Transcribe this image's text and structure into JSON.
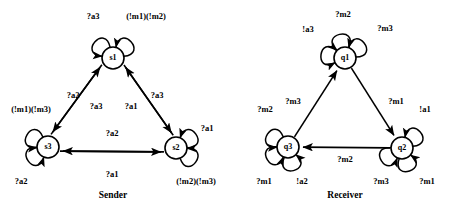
{
  "figure": {
    "background_color": "#ffffff",
    "stroke_color": "#000000",
    "width": 461,
    "height": 219
  },
  "diagrams": [
    {
      "id": "sender",
      "caption": "Sender",
      "caption_pos": {
        "x": 113,
        "y": 196
      },
      "nodes": [
        {
          "id": "s1",
          "label": "s1",
          "cx": 113,
          "cy": 58,
          "r": 11
        },
        {
          "id": "s3",
          "label": "s3",
          "cx": 48,
          "cy": 147,
          "r": 11
        },
        {
          "id": "s2",
          "label": "s2",
          "cx": 176,
          "cy": 148,
          "r": 11
        }
      ],
      "self_loops": [
        {
          "node": "s1",
          "label": "?a3",
          "angle": 138,
          "label_x": 93,
          "label_y": 17
        },
        {
          "node": "s1",
          "label": "(!m1)(!m2)",
          "angle": 42,
          "label_x": 146,
          "label_y": 17
        },
        {
          "node": "s3",
          "label": "(!m1)(!m3)",
          "angle": 150,
          "label_x": 31,
          "label_y": 110
        },
        {
          "node": "s3",
          "label": "?a2",
          "angle": 215,
          "label_x": 21,
          "label_y": 182
        },
        {
          "node": "s2",
          "label": "?a1",
          "angle": 35,
          "label_x": 207,
          "label_y": 129
        },
        {
          "node": "s2",
          "label": "(!m2)(!m3)",
          "angle": 325,
          "label_x": 196,
          "label_y": 182
        }
      ],
      "edges": [
        {
          "from": "s3",
          "to": "s1",
          "label": "?a2",
          "dir": "up",
          "offset": -5,
          "label_x": 73,
          "label_y": 96
        },
        {
          "from": "s1",
          "to": "s3",
          "label": "?a3",
          "dir": "down",
          "offset": 5,
          "label_x": 96,
          "label_y": 107
        },
        {
          "from": "s2",
          "to": "s1",
          "label": "?a1",
          "dir": "up",
          "offset": 5,
          "label_x": 131,
          "label_y": 107
        },
        {
          "from": "s1",
          "to": "s2",
          "label": "?a3",
          "dir": "down",
          "offset": -5,
          "label_x": 157,
          "label_y": 96
        },
        {
          "from": "s2",
          "to": "s3",
          "label": "?a2",
          "dir": "left",
          "offset": -4,
          "label_x": 112,
          "label_y": 134
        },
        {
          "from": "s3",
          "to": "s2",
          "label": "?a1",
          "dir": "right",
          "offset": 4,
          "label_x": 112,
          "label_y": 175
        }
      ]
    },
    {
      "id": "receiver",
      "caption": "Receiver",
      "caption_pos": {
        "x": 345,
        "y": 196
      },
      "nodes": [
        {
          "id": "q1",
          "label": "q1",
          "cx": 345,
          "cy": 58,
          "r": 11
        },
        {
          "id": "q3",
          "label": "q3",
          "cx": 288,
          "cy": 147,
          "r": 11
        },
        {
          "id": "q2",
          "label": "q2",
          "cx": 402,
          "cy": 148,
          "r": 11
        }
      ],
      "self_loops": [
        {
          "node": "q1",
          "label": "!a3",
          "angle": 172,
          "label_x": 308,
          "label_y": 30
        },
        {
          "node": "q1",
          "label": "?m2",
          "angle": 103,
          "label_x": 343,
          "label_y": 15
        },
        {
          "node": "q1",
          "label": "?m3",
          "angle": 38,
          "label_x": 385,
          "label_y": 29
        },
        {
          "node": "q3",
          "label": "?m2",
          "angle": 148,
          "label_x": 265,
          "label_y": 110
        },
        {
          "node": "q3",
          "label": "?m1",
          "angle": 212,
          "label_x": 264,
          "label_y": 182
        },
        {
          "node": "q3",
          "label": "!a2",
          "angle": 283,
          "label_x": 302,
          "label_y": 182
        },
        {
          "node": "q2",
          "label": "!a1",
          "angle": 42,
          "label_x": 425,
          "label_y": 110
        },
        {
          "node": "q2",
          "label": "?m3",
          "angle": 212,
          "label_x": 381,
          "label_y": 182
        },
        {
          "node": "q2",
          "label": "?m1",
          "angle": 288,
          "label_x": 427,
          "label_y": 182
        }
      ],
      "edges": [
        {
          "from": "q3",
          "to": "q1",
          "label": "?m3",
          "dir": "up",
          "offset": 0,
          "label_x": 293,
          "label_y": 102
        },
        {
          "from": "q1",
          "to": "q2",
          "label": "?m1",
          "dir": "down",
          "offset": 0,
          "label_x": 396,
          "label_y": 102
        },
        {
          "from": "q2",
          "to": "q3",
          "label": "?m2",
          "dir": "left",
          "offset": 0,
          "label_x": 345,
          "label_y": 160
        }
      ]
    }
  ]
}
